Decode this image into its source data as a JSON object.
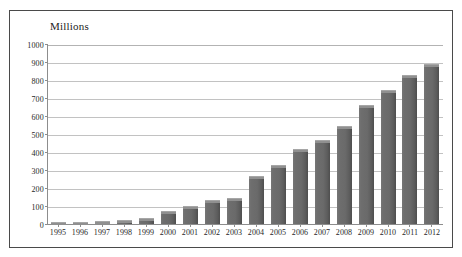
{
  "figure": {
    "cut_caption_sliver": "",
    "frame_color": "#4a4a4a"
  },
  "chart_data": {
    "type": "bar",
    "title": "Millions",
    "subtitle": "",
    "xlabel": "",
    "ylabel": "Millions",
    "ylim": [
      0,
      1000
    ],
    "ytick_values": [
      0,
      100,
      200,
      300,
      400,
      500,
      600,
      700,
      800,
      900,
      1000
    ],
    "ytick_labels": [
      "0",
      "100",
      "200",
      "300",
      "400",
      "500",
      "600",
      "700",
      "800",
      "900",
      "1000"
    ],
    "grid": true,
    "legend": false,
    "legend_position": "none",
    "bar_color": "#6a6a6a",
    "categories": [
      "1995",
      "1996",
      "1997",
      "1998",
      "1999",
      "2000",
      "2001",
      "2002",
      "2003",
      "2004",
      "2005",
      "2006",
      "2007",
      "2008",
      "2009",
      "2010",
      "2011",
      "2012"
    ],
    "values": [
      5,
      10,
      17,
      23,
      35,
      70,
      100,
      135,
      145,
      265,
      330,
      415,
      465,
      545,
      660,
      745,
      830,
      890
    ]
  }
}
